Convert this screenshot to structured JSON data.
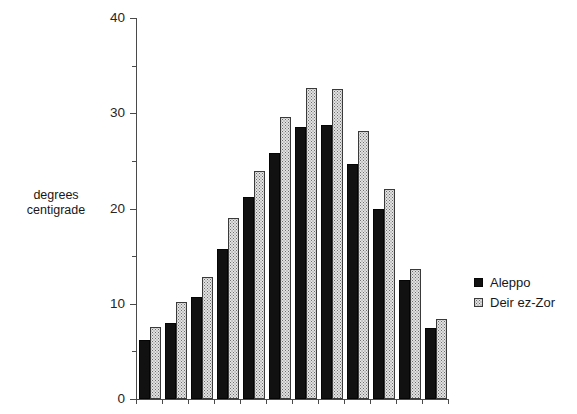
{
  "chart_data": {
    "type": "bar",
    "title": "",
    "subtitle": "",
    "xlabel": "",
    "ylabel": "degrees\ncentigrade",
    "ylim": [
      0,
      40
    ],
    "yticks": [
      0,
      10,
      20,
      30,
      40
    ],
    "ytick_labels": [
      "0",
      "10",
      "20",
      "30",
      "40"
    ],
    "yminor_ticks": [
      5,
      15,
      25,
      35
    ],
    "grid": false,
    "legend_position": "right",
    "xtick_labels": [],
    "categories": [
      "1",
      "2",
      "3",
      "4",
      "5",
      "6",
      "7",
      "8",
      "9",
      "10",
      "11",
      "12"
    ],
    "series": [
      {
        "name": "Aleppo",
        "color": "#111111",
        "values": [
          6.2,
          8.0,
          10.7,
          15.8,
          21.2,
          25.8,
          28.6,
          28.8,
          24.7,
          20.0,
          12.5,
          7.5
        ]
      },
      {
        "name": "Deir ez-Zor",
        "color": "#e2e2e2",
        "values": [
          7.6,
          10.2,
          12.8,
          19.0,
          23.9,
          29.6,
          32.7,
          32.5,
          28.1,
          22.0,
          13.7,
          8.4
        ]
      }
    ]
  },
  "legend": {
    "items": [
      {
        "label": "Aleppo",
        "swatch": "aleppo"
      },
      {
        "label": "Deir ez-Zor",
        "swatch": "deir"
      }
    ]
  },
  "axis": {
    "y_label_text": "degrees\ncentigrade"
  }
}
